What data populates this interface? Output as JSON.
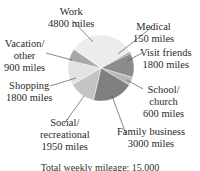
{
  "chart_data": {
    "type": "pie",
    "title": "",
    "caption": "Total weekly mileage: 15,000",
    "unit": "miles",
    "total": 15000,
    "start_angle_deg": 60,
    "direction": "clockwise",
    "slices": [
      {
        "label": "Medical",
        "value": 150,
        "color": "#9a9a9a"
      },
      {
        "label": "Visit friends",
        "value": 1800,
        "color": "#8c8c8c"
      },
      {
        "label": "School/ church",
        "value": 600,
        "color": "#b8b8b8"
      },
      {
        "label": "Family business",
        "value": 3000,
        "color": "#7f7f7f"
      },
      {
        "label": "Social/ recreational",
        "value": 1950,
        "color": "#c4c4c4"
      },
      {
        "label": "Shopping",
        "value": 1800,
        "color": "#e2e2e2"
      },
      {
        "label": "Vacation/ other",
        "value": 900,
        "color": "#a8a8a8"
      },
      {
        "label": "Work",
        "value": 4800,
        "color": "#ececec"
      }
    ]
  },
  "labels": {
    "work": {
      "name": "Work",
      "value": "4800 miles"
    },
    "medical": {
      "name": "Medical",
      "value": "150 miles"
    },
    "visit": {
      "name": "Visit friends",
      "value": "1800 miles"
    },
    "school": {
      "line1": "School/",
      "line2": "church",
      "value": "600 miles"
    },
    "family": {
      "name": "Family business",
      "value": "3000 miles"
    },
    "social": {
      "line1": "Social/",
      "line2": "recreational",
      "value": "1950 miles"
    },
    "shopping": {
      "name": "Shopping",
      "value": "1800 miles"
    },
    "vacation": {
      "line1": "Vacation/",
      "line2": "other",
      "value": "900 miles"
    }
  },
  "caption": "Total weekly mileage: 15,000"
}
